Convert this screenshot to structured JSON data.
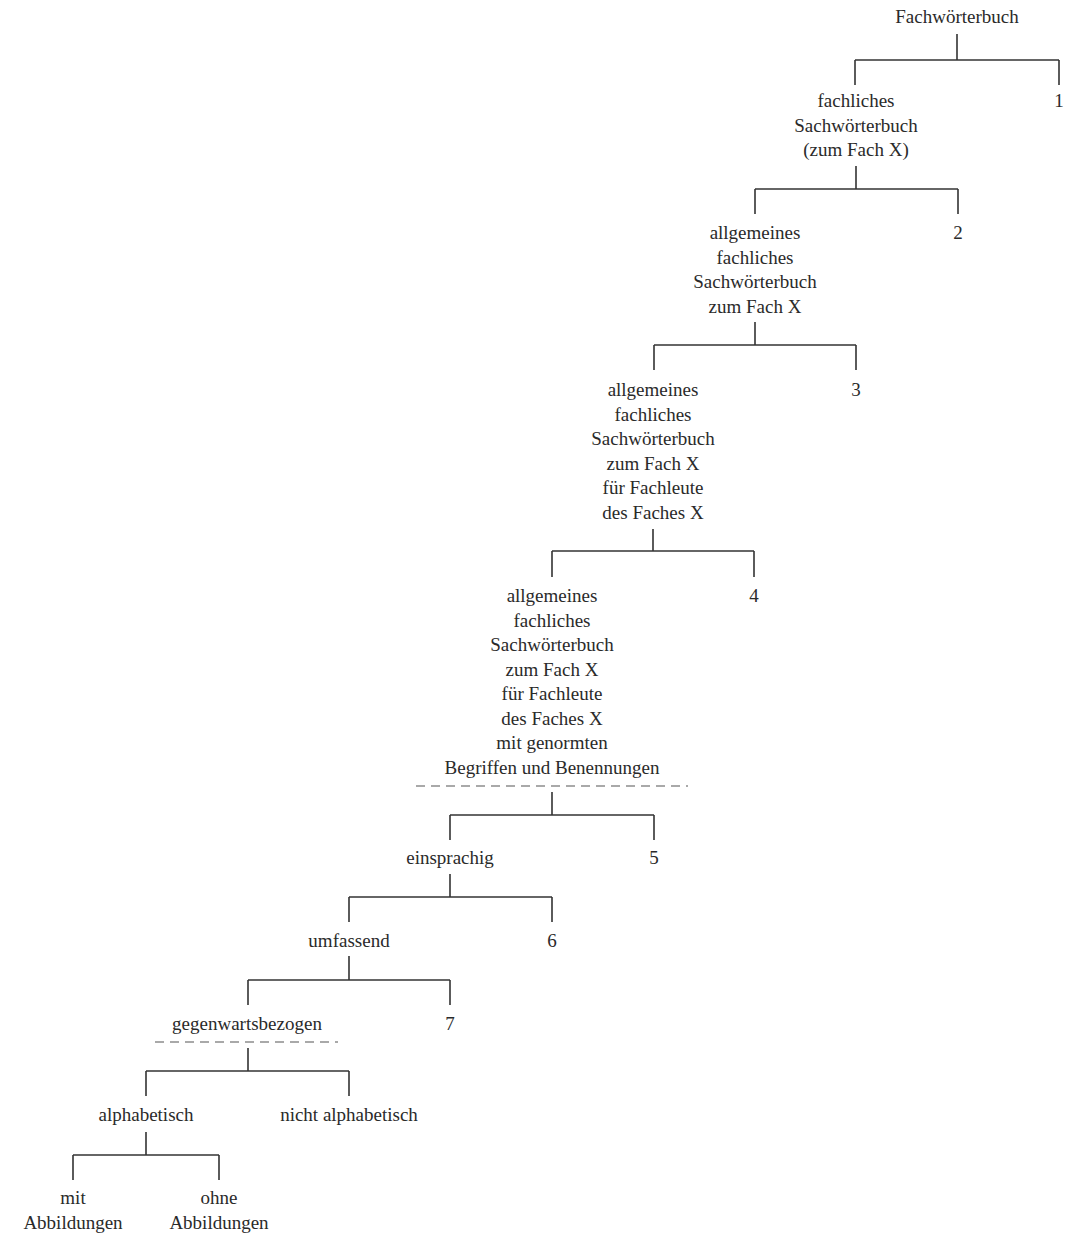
{
  "diagram": {
    "type": "tree",
    "root": "Fachwörterbuch",
    "levels": [
      {
        "node": [
          "fachliches",
          "Sachwörterbuch",
          "(zum Fach X)"
        ],
        "branch_number": "1"
      },
      {
        "node": [
          "allgemeines",
          "fachliches",
          "Sachwörterbuch",
          "zum Fach X"
        ],
        "branch_number": "2"
      },
      {
        "node": [
          "allgemeines",
          "fachliches",
          "Sachwörterbuch",
          "zum Fach X",
          "für Fachleute",
          "des Faches X"
        ],
        "branch_number": "3"
      },
      {
        "node": [
          "allgemeines",
          "fachliches",
          "Sachwörterbuch",
          "zum Fach X",
          "für Fachleute",
          "des Faches X",
          "mit genormten",
          "Begriffen und Benennungen"
        ],
        "branch_number": "4",
        "dashed_underline": true
      },
      {
        "node": [
          "einsprachig"
        ],
        "branch_number": "5"
      },
      {
        "node": [
          "umfassend"
        ],
        "branch_number": "6"
      },
      {
        "node": [
          "gegenwartsbezogen"
        ],
        "branch_number": "7",
        "dashed_underline": true
      }
    ],
    "final_split": {
      "left": "alphabetisch",
      "right": "nicht alphabetisch",
      "left_children": [
        [
          "mit",
          "Abbildungen"
        ],
        [
          "ohne",
          "Abbildungen"
        ]
      ]
    }
  }
}
